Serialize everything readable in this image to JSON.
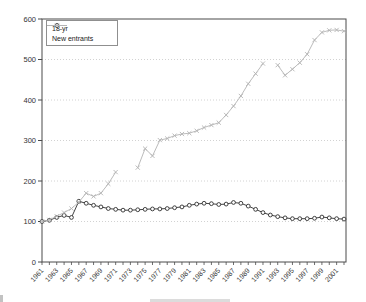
{
  "chart_data": {
    "type": "line",
    "title": "",
    "xlabel": "",
    "ylabel": "",
    "x": [
      1961,
      1962,
      1963,
      1964,
      1965,
      1966,
      1967,
      1968,
      1969,
      1970,
      1971,
      1972,
      1973,
      1974,
      1975,
      1976,
      1977,
      1978,
      1979,
      1980,
      1981,
      1982,
      1983,
      1984,
      1985,
      1986,
      1987,
      1988,
      1989,
      1990,
      1991,
      1992,
      1993,
      1994,
      1995,
      1996,
      1997,
      1998,
      1999,
      2000,
      2001,
      2002
    ],
    "x_tick_labels": [
      "1961",
      "1963",
      "1965",
      "1967",
      "1969",
      "1971",
      "1973",
      "1975",
      "1977",
      "1979",
      "1981",
      "1983",
      "1985",
      "1987",
      "1989",
      "1991",
      "1993",
      "1995",
      "1997",
      "1999",
      "2001"
    ],
    "x_tick_label_years": [
      1961,
      1963,
      1965,
      1967,
      1969,
      1971,
      1973,
      1975,
      1977,
      1979,
      1981,
      1983,
      1985,
      1987,
      1989,
      1991,
      1993,
      1995,
      1997,
      1999,
      2001
    ],
    "ylim": [
      0,
      600
    ],
    "y_ticks": [
      0,
      100,
      200,
      300,
      400,
      500,
      600
    ],
    "y_tick_labels": [
      "0",
      "100",
      "200",
      "300",
      "400",
      "500",
      "600"
    ],
    "grid": "horizontal-dotted",
    "legend_position": "top-left",
    "series": [
      {
        "name": "18-yr",
        "marker": "circle-open",
        "color": "#2e2e2e",
        "values": [
          100,
          103,
          110,
          115,
          110,
          150,
          145,
          140,
          136,
          132,
          130,
          128,
          128,
          129,
          130,
          131,
          131,
          132,
          134,
          136,
          140,
          143,
          145,
          144,
          142,
          143,
          147,
          145,
          138,
          130,
          122,
          116,
          112,
          109,
          107,
          107,
          107,
          108,
          111,
          109,
          107,
          106
        ]
      },
      {
        "name": "New entrants",
        "marker": "x",
        "color": "#b3b3b3",
        "values": [
          100,
          104,
          113,
          122,
          132,
          148,
          170,
          162,
          170,
          193,
          222,
          null,
          null,
          233,
          280,
          262,
          301,
          305,
          312,
          316,
          318,
          324,
          332,
          338,
          344,
          363,
          385,
          410,
          440,
          465,
          490,
          null,
          486,
          461,
          476,
          492,
          513,
          548,
          567,
          572,
          573,
          570
        ]
      }
    ]
  },
  "colors": {
    "background": "#ffffff",
    "plot_border": "#4a4a4a",
    "gridline": "#c7c7c7",
    "tick_label": "#333333",
    "legend_border": "#8f8f8f",
    "series_18yr": "#2e2e2e",
    "series_new_entrants": "#b3b3b3"
  }
}
